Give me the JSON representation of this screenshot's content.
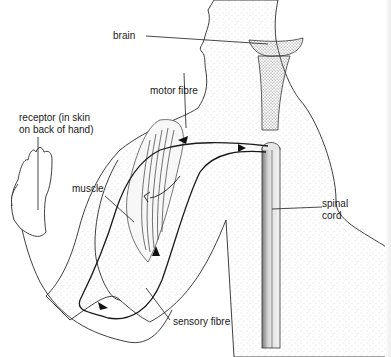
{
  "diagram": {
    "type": "anatomical-line-drawing",
    "labels": {
      "brain": "brain",
      "motor_fibre": "motor fibre",
      "receptor_line1": "receptor (in skin",
      "receptor_line2": "on back of hand)",
      "muscle": "muscle",
      "spinal_line1": "spinal",
      "spinal_line2": "cord",
      "sensory_fibre": "sensory fibre"
    },
    "colors": {
      "ink": "#1a1a1a",
      "stipple": "#9a9a9a",
      "background": "#ffffff"
    }
  }
}
